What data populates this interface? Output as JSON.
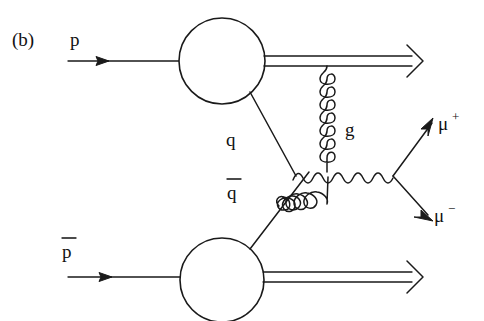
{
  "figure": {
    "panel_label": "(b)",
    "background_color": "#ffffff",
    "line_color": "#1a1a1a",
    "width": 484,
    "height": 321,
    "type": "feynman-diagram"
  },
  "labels": {
    "proton": "p",
    "antiproton_base": "p",
    "antiproton_bar": true,
    "quark": "q",
    "antiquark_base": "q",
    "antiquark_bar": true,
    "gluon": "g",
    "muon_plus_base": "μ",
    "muon_plus_charge": "+",
    "muon_minus_base": "μ",
    "muon_minus_charge": "−"
  },
  "particles": [
    {
      "name": "incoming-proton",
      "label": "p",
      "kind": "fermion-line",
      "direction": "rightward"
    },
    {
      "name": "incoming-antiproton",
      "label": "p̄",
      "kind": "fermion-line",
      "direction": "rightward"
    },
    {
      "name": "proton-remnant",
      "label": "",
      "kind": "double-line",
      "direction": "rightward"
    },
    {
      "name": "antiproton-remnant",
      "label": "",
      "kind": "double-line",
      "direction": "rightward"
    },
    {
      "name": "quark",
      "label": "q",
      "kind": "fermion-line"
    },
    {
      "name": "antiquark",
      "label": "q̄",
      "kind": "fermion-line"
    },
    {
      "name": "gluon-vertical",
      "label": "g",
      "kind": "gluon-coil"
    },
    {
      "name": "gluon-diagonal",
      "label": "",
      "kind": "gluon-coil"
    },
    {
      "name": "virtual-photon",
      "label": "",
      "kind": "wavy-line"
    },
    {
      "name": "muon-plus",
      "label": "μ+",
      "kind": "fermion-line"
    },
    {
      "name": "muon-minus",
      "label": "μ−",
      "kind": "fermion-line"
    }
  ],
  "vertices": [
    {
      "name": "top-blob",
      "cx": 222,
      "cy": 61,
      "r": 43
    },
    {
      "name": "bottom-blob",
      "cx": 222,
      "cy": 280,
      "r": 42
    },
    {
      "name": "qqbar-vertex",
      "x": 296,
      "y": 176
    },
    {
      "name": "muon-vertex",
      "x": 393,
      "y": 176
    },
    {
      "name": "gluon-split",
      "x": 328,
      "y": 177
    }
  ]
}
